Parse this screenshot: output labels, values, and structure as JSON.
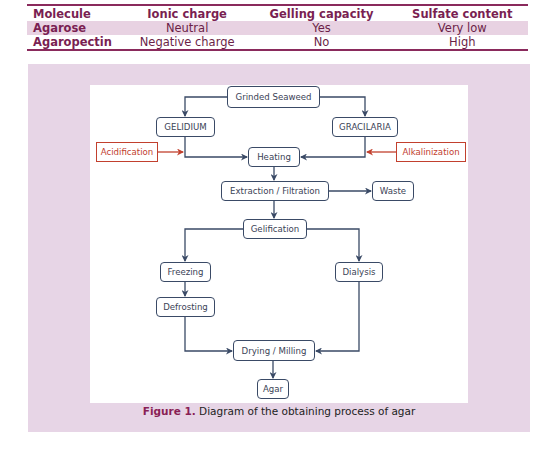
{
  "table": {
    "headers": [
      "Molecule",
      "Ionic charge",
      "Gelling capacity",
      "Sulfate content"
    ],
    "rows": [
      [
        "Agarose",
        "Neutral",
        "Yes",
        "Very low"
      ],
      [
        "Agaropectin",
        "Negative charge",
        "No",
        "High"
      ]
    ]
  },
  "diagram": {
    "nodes": {
      "grinded_seaweed": "Grinded Seaweed",
      "gelidium": "GELIDIUM",
      "gracilaria": "GRACILARIA",
      "acidification": "Acidification",
      "alkalinization": "Alkalinization",
      "heating": "Heating",
      "extraction": "Extraction / Filtration",
      "waste": "Waste",
      "gelification": "Gelification",
      "freezing": "Freezing",
      "dialysis": "Dialysis",
      "defrosting": "Defrosting",
      "drying": "Drying / Milling",
      "agar": "Agar"
    },
    "colors": {
      "box_border": "#3a4a66",
      "treatment_border": "#c2402e",
      "panel_bg": "#e7d5e6",
      "accent": "#8a1f55"
    }
  },
  "caption": {
    "label": "Figure 1.",
    "text": " Diagram of the obtaining process of agar"
  }
}
